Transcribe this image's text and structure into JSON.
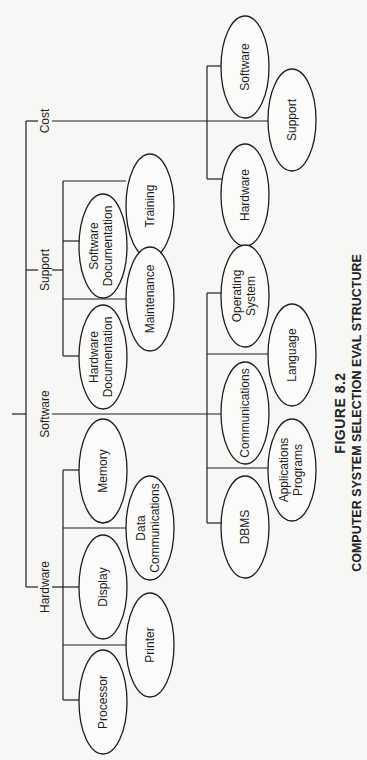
{
  "figure": {
    "number_label": "FIGURE 8.2",
    "title": "COMPUTER SYSTEM SELECTION EVAL STRUCTURE"
  },
  "tree": {
    "branches": [
      {
        "label": "Hardware",
        "children": [
          "Processor",
          "Printer",
          "Display",
          "Data Communications",
          "Memory"
        ]
      },
      {
        "label": "Software",
        "children": [
          "DBMS",
          "Applications Programs",
          "Communications",
          "Language",
          "Operating System"
        ]
      },
      {
        "label": "Support",
        "children": [
          "Hardware Documentation",
          "Maintenance",
          "Software Documentation",
          "Training"
        ]
      },
      {
        "label": "Cost",
        "children": [
          "Hardware",
          "Support",
          "Software"
        ]
      }
    ]
  },
  "labels": {
    "hardware": "Hardware",
    "software": "Software",
    "support": "Support",
    "cost": "Cost",
    "processor": "Processor",
    "printer": "Printer",
    "display": "Display",
    "data_comm_1": "Data",
    "data_comm_2": "Communications",
    "memory": "Memory",
    "dbms": "DBMS",
    "app_prog_1": "Applications",
    "app_prog_2": "Programs",
    "communications": "Communications",
    "language": "Language",
    "os_1": "Operating",
    "os_2": "System",
    "hw_doc_1": "Hardware",
    "hw_doc_2": "Documentation",
    "maintenance": "Maintenance",
    "sw_doc_1": "Software",
    "sw_doc_2": "Documentation",
    "training": "Training",
    "cost_hardware": "Hardware",
    "cost_support": "Support",
    "cost_software": "Software"
  }
}
